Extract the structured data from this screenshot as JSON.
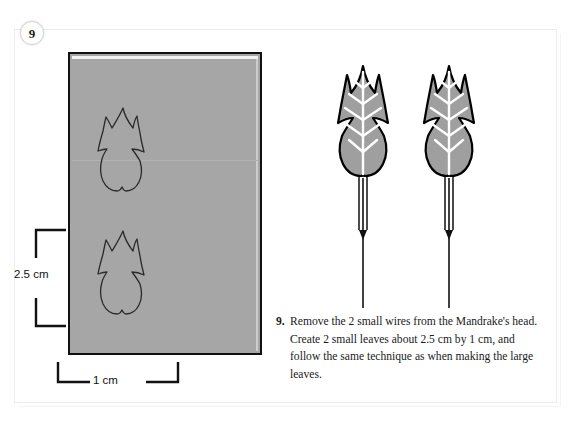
{
  "page": {
    "step_number": "9",
    "background_color": "#ffffff",
    "frame_color": "#ededed"
  },
  "materials": {
    "foam_sheet": {
      "name": "gray foam sheet",
      "fill_color": "#a6a6a6",
      "outline_color": "#111111",
      "traced_shape_count": 2,
      "traced_shape_name": "small leaf outline"
    }
  },
  "dimensions": {
    "vertical": {
      "label": "2.5 cm",
      "orientation": "vertical",
      "measures": "leaf height"
    },
    "horizontal": {
      "label": "1 cm",
      "orientation": "horizontal",
      "measures": "leaf width"
    }
  },
  "finished_leaves": {
    "count": 2,
    "leaf_fill_color": "#9f9f9f",
    "vein_color": "#ffffff",
    "outline_color": "#000000",
    "stem_color": "#111111",
    "items": [
      {
        "name": "small-leaf-left"
      },
      {
        "name": "small-leaf-right"
      }
    ]
  },
  "instruction": {
    "number": "9.",
    "text": "Remove the 2 small wires from the Mandrake's head. Create 2 small leaves about 2.5 cm by 1 cm, and follow the same technique as when making the large leaves."
  }
}
